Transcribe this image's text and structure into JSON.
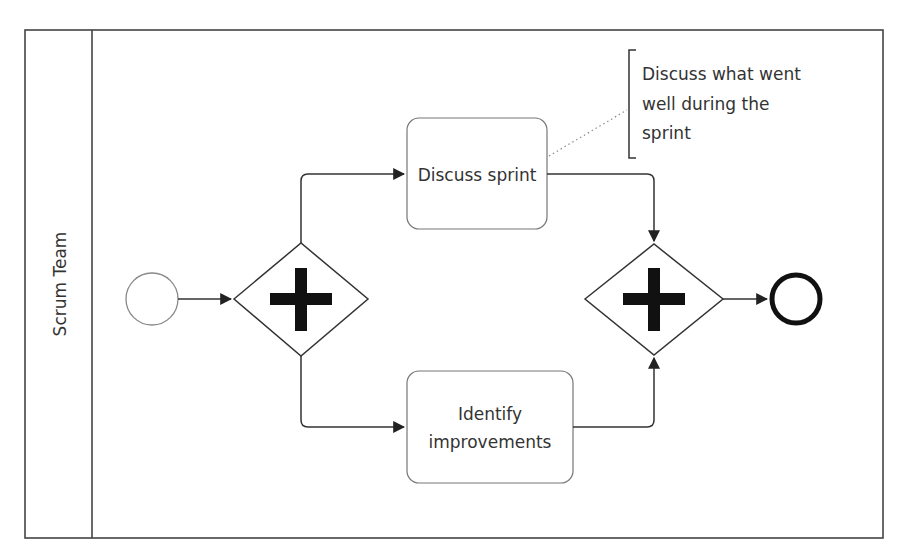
{
  "diagram": {
    "type": "BPMN process",
    "pool": {
      "lane_label": "Scrum Team"
    },
    "start_event": {
      "label": ""
    },
    "split_gateway": {
      "type": "parallel",
      "symbol": "+"
    },
    "tasks": [
      {
        "id": "discuss-sprint",
        "label": "Discuss sprint"
      },
      {
        "id": "identify-improvements",
        "label_line1": "Identify",
        "label_line2": "improvements"
      }
    ],
    "join_gateway": {
      "type": "parallel",
      "symbol": "+"
    },
    "end_event": {
      "label": ""
    },
    "annotation": {
      "line1": "Discuss what went",
      "line2": "well during the",
      "line3": "sprint"
    },
    "colors": {
      "stroke": "#333333",
      "task_stroke": "#777777",
      "background": "#ffffff"
    }
  }
}
